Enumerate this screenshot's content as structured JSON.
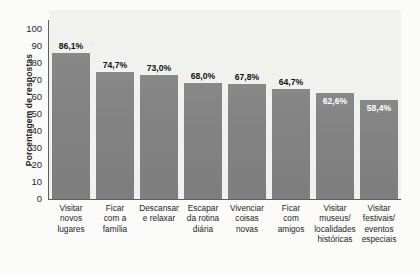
{
  "chart_data": {
    "type": "bar",
    "title": "",
    "subtitle": "",
    "xlabel": "",
    "ylabel": "Porcentagem de respostas",
    "ylim": [
      0,
      100
    ],
    "ytick_step": 10,
    "yticks": [
      "100",
      "90",
      "80",
      "70",
      "60",
      "50",
      "40",
      "30",
      "20",
      "10",
      "0"
    ],
    "grid": false,
    "legend": "none",
    "value_suffix": "%",
    "decimal_separator": ",",
    "categories": [
      "Visitar novos lugares",
      "Ficar com a família",
      "Descansar e relaxar",
      "Escapar da rotina diária",
      "Vivenciar coisas novas",
      "Ficar com amigos",
      "Visitar museus/ localidades históricas",
      "Visitar festivais/ eventos especiais"
    ],
    "category_lines": [
      [
        "Visitar",
        "novos",
        "lugares"
      ],
      [
        "Ficar",
        "com a",
        "família"
      ],
      [
        "Descansar",
        "e relaxar"
      ],
      [
        "Escapar",
        "da rotina",
        "diária"
      ],
      [
        "Vivenciar",
        "coisas",
        "novas"
      ],
      [
        "Ficar",
        "com",
        "amigos"
      ],
      [
        "Visitar",
        "museus/",
        "localidades",
        "históricas"
      ],
      [
        "Visitar",
        "festivais/",
        "eventos",
        "especiais"
      ]
    ],
    "values": [
      86.1,
      74.7,
      73.0,
      68.0,
      67.8,
      64.7,
      62.6,
      58.4
    ],
    "value_labels": [
      "86,1%",
      "74,7%",
      "73,0%",
      "68,0%",
      "67,8%",
      "64,7%",
      "62,6%",
      "58,4%"
    ],
    "label_placement": [
      "above",
      "above",
      "above",
      "above",
      "above",
      "above",
      "inside",
      "inside"
    ],
    "colors": {
      "bar": "#828282",
      "plot_background": "#f1f1ef",
      "page_background": "#fbfbf9",
      "axis": "#5d5d5d",
      "label_text": "#111111",
      "inside_label_text": "#ffffff"
    }
  }
}
